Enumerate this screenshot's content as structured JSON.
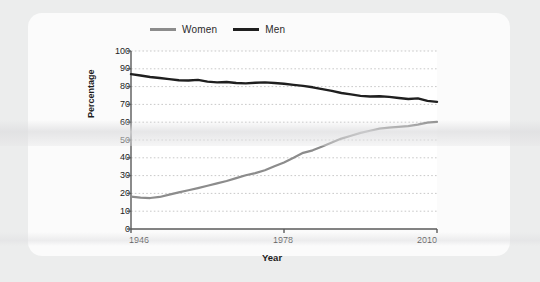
{
  "card": {
    "background_color": "#fbfbfb",
    "page_background_color": "#eceded"
  },
  "chart_data": {
    "type": "line",
    "title": "",
    "xlabel": "Year",
    "ylabel": "Percentage",
    "xlim": [
      1946,
      2010
    ],
    "ylim": [
      0,
      100
    ],
    "grid": true,
    "legend_position": "top",
    "x_ticks": [
      "1946",
      "1978",
      "2010"
    ],
    "x_tick_values": [
      1946,
      1978,
      2010
    ],
    "y_ticks": [
      "0",
      "10",
      "20",
      "30",
      "40",
      "50",
      "60",
      "70",
      "80",
      "90",
      "100"
    ],
    "y_tick_values": [
      0,
      10,
      20,
      30,
      40,
      50,
      60,
      70,
      80,
      90,
      100
    ],
    "series": [
      {
        "name": "Women",
        "color": "#8c8c8c",
        "x": [
          1946,
          1948,
          1950,
          1952,
          1954,
          1956,
          1958,
          1960,
          1962,
          1964,
          1966,
          1968,
          1970,
          1972,
          1974,
          1976,
          1978,
          1980,
          1982,
          1984,
          1986,
          1988,
          1990,
          1992,
          1994,
          1996,
          1998,
          2000,
          2002,
          2004,
          2006,
          2008,
          2010
        ],
        "values": [
          18.2,
          17.6,
          17.4,
          18.0,
          19.3,
          20.6,
          21.8,
          23.0,
          24.3,
          25.6,
          27.0,
          28.6,
          30.2,
          31.4,
          33.0,
          35.2,
          37.4,
          40.0,
          42.8,
          44.2,
          46.4,
          48.6,
          50.8,
          52.4,
          54.0,
          55.2,
          56.4,
          57.0,
          57.4,
          57.8,
          58.6,
          59.8,
          60.2
        ]
      },
      {
        "name": "Men",
        "color": "#1f1f1f",
        "x": [
          1946,
          1948,
          1950,
          1952,
          1954,
          1956,
          1958,
          1960,
          1962,
          1964,
          1966,
          1968,
          1970,
          1972,
          1974,
          1976,
          1978,
          1980,
          1982,
          1984,
          1986,
          1988,
          1990,
          1992,
          1994,
          1996,
          1998,
          2000,
          2002,
          2004,
          2006,
          2008,
          2010
        ],
        "values": [
          87.0,
          86.2,
          85.4,
          84.8,
          84.2,
          83.6,
          83.4,
          83.8,
          82.8,
          82.4,
          82.6,
          82.0,
          81.8,
          82.2,
          82.4,
          82.0,
          81.6,
          81.0,
          80.4,
          79.6,
          78.6,
          77.6,
          76.4,
          75.6,
          74.8,
          74.4,
          74.6,
          74.2,
          73.6,
          73.0,
          73.4,
          72.0,
          71.4
        ]
      }
    ],
    "legend": [
      {
        "label": "Women",
        "color": "#8c8c8c"
      },
      {
        "label": "Men",
        "color": "#1f1f1f"
      }
    ]
  }
}
